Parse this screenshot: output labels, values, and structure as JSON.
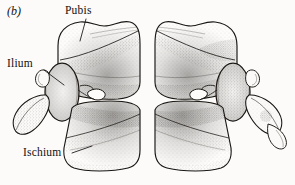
{
  "figure": {
    "panel_letter": "(b)",
    "background_color": "#fcfbf9",
    "ink_color": "#12100e",
    "style": "stipple-and-line scientific illustration",
    "width": 295,
    "height": 185
  },
  "labels": {
    "pubis": "Pubis",
    "ilium": "Ilium",
    "ischium": "Ischium"
  },
  "leader_lines": [
    {
      "name": "pubis-leader",
      "from_x": 86,
      "from_y": 19,
      "to_x": 80,
      "to_y": 40
    },
    {
      "name": "ilium-leader",
      "from_x": 44,
      "from_y": 70,
      "to_x": 64,
      "to_y": 85
    },
    {
      "name": "ischium-leader",
      "from_x": 72,
      "from_y": 153,
      "to_x": 92,
      "to_y": 146
    }
  ],
  "anatomy": {
    "halves": [
      "left innominate",
      "right innominate"
    ],
    "elements": [
      "pubis",
      "ilium",
      "ischium"
    ],
    "symmetry": "bilateral mirror about vertical midline"
  }
}
